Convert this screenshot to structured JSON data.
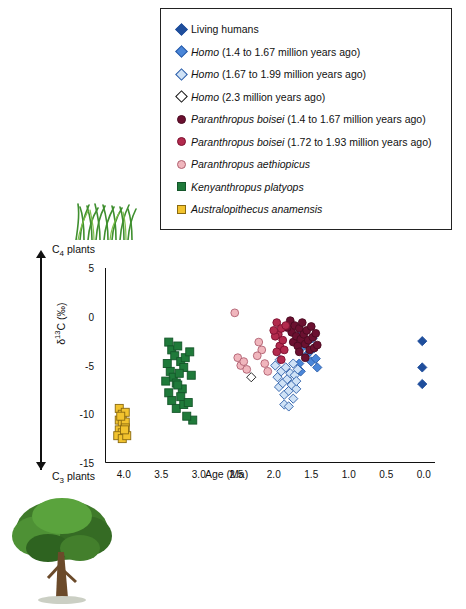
{
  "legend": {
    "items": [
      {
        "label": "Living humans",
        "shape": "diamond",
        "fill": "#1f4e9c",
        "stroke": "#1f4e9c",
        "italic_prefix": ""
      },
      {
        "label": "(1.4 to 1.67 million years ago)",
        "shape": "diamond",
        "fill": "#4a86d8",
        "stroke": "#2a5ca8",
        "italic_prefix": "Homo"
      },
      {
        "label": "(1.67 to 1.99 million years ago)",
        "shape": "diamond",
        "fill": "#cfe2f6",
        "stroke": "#2a5ca8",
        "italic_prefix": "Homo"
      },
      {
        "label": "(2.3 million years ago)",
        "shape": "diamond",
        "fill": "#ffffff",
        "stroke": "#111111",
        "italic_prefix": "Homo"
      },
      {
        "label": "(1.4 to 1.67 million years ago)",
        "shape": "circle",
        "fill": "#6b1030",
        "stroke": "#4a0a20",
        "italic_prefix": "Paranthropus boisei"
      },
      {
        "label": "(1.72 to 1.93 million years ago)",
        "shape": "circle",
        "fill": "#b22a4d",
        "stroke": "#7d1030",
        "italic_prefix": "Paranthropus boisei"
      },
      {
        "label": "",
        "shape": "circle",
        "fill": "#f0b6bd",
        "stroke": "#b06070",
        "italic_prefix": "Paranthropus aethiopicus"
      },
      {
        "label": "",
        "shape": "square",
        "fill": "#1f7a3a",
        "stroke": "#14562a",
        "italic_prefix": "Kenyanthropus platyops"
      },
      {
        "label": "",
        "shape": "square",
        "fill": "#f2c32e",
        "stroke": "#8a6a10",
        "italic_prefix": "Australopithecus anamensis"
      }
    ]
  },
  "annotations": {
    "c4_label": "C4 plants",
    "c4_sub": "4",
    "c3_label": "C3 plants",
    "c3_sub": "3"
  },
  "chart_data": {
    "type": "scatter",
    "title": "",
    "xlabel": "Age (Ma)",
    "ylabel": "δ¹³C (‰)",
    "xlim": [
      4.25,
      -0.15
    ],
    "ylim": [
      -15,
      5
    ],
    "xticks": [
      "4.0",
      "3.5",
      "3.0",
      "2.5",
      "2.0",
      "1.5",
      "1.0",
      "0.5",
      "0.0"
    ],
    "xtickvals": [
      4.0,
      3.5,
      3.0,
      2.5,
      2.0,
      1.5,
      1.0,
      0.5,
      0.0
    ],
    "yticks": [
      "5",
      "0",
      "-5",
      "-10",
      "-15"
    ],
    "ytickvals": [
      5,
      0,
      -5,
      -10,
      -15
    ],
    "grid": false,
    "legend_position": "top",
    "series": [
      {
        "name": "Living humans",
        "shape": "diamond",
        "fill": "#1f4e9c",
        "stroke": "#1f4e9c",
        "points": [
          [
            0.02,
            -2.5
          ],
          [
            0.02,
            -5.2
          ],
          [
            0.02,
            -6.9
          ]
        ]
      },
      {
        "name": "Homo (1.4 to 1.67 million years ago)",
        "shape": "diamond",
        "fill": "#4a86d8",
        "stroke": "#2a5ca8",
        "points": [
          [
            1.62,
            -1.6
          ],
          [
            1.6,
            -3.0
          ],
          [
            1.57,
            -4.0
          ],
          [
            1.55,
            -2.6
          ],
          [
            1.52,
            -3.6
          ],
          [
            1.5,
            -4.6
          ],
          [
            1.48,
            -2.2
          ],
          [
            1.46,
            -3.2
          ],
          [
            1.44,
            -4.3
          ],
          [
            1.42,
            -5.2
          ],
          [
            1.66,
            -4.8
          ],
          [
            1.64,
            -5.6
          ]
        ]
      },
      {
        "name": "Homo (1.67 to 1.99 million years ago)",
        "shape": "diamond",
        "fill": "#cfe2f6",
        "stroke": "#2a5ca8",
        "points": [
          [
            1.98,
            -5.0
          ],
          [
            1.95,
            -6.2
          ],
          [
            1.93,
            -7.2
          ],
          [
            1.9,
            -5.6
          ],
          [
            1.88,
            -6.8
          ],
          [
            1.86,
            -8.0
          ],
          [
            1.84,
            -5.2
          ],
          [
            1.82,
            -6.4
          ],
          [
            1.8,
            -7.6
          ],
          [
            1.78,
            -5.8
          ],
          [
            1.76,
            -7.0
          ],
          [
            1.74,
            -8.4
          ],
          [
            1.72,
            -6.0
          ],
          [
            1.7,
            -7.4
          ],
          [
            1.68,
            -5.4
          ],
          [
            1.86,
            -9.0
          ],
          [
            1.8,
            -9.2
          ],
          [
            1.92,
            -4.4
          ],
          [
            1.74,
            -4.8
          ],
          [
            1.7,
            -6.6
          ]
        ]
      },
      {
        "name": "Homo (2.3 million years ago)",
        "shape": "diamond",
        "fill": "#ffffff",
        "stroke": "#111111",
        "points": [
          [
            2.3,
            -6.2
          ]
        ]
      },
      {
        "name": "Paranthropus boisei (1.4 to 1.67 million years ago)",
        "shape": "circle",
        "fill": "#6b1030",
        "stroke": "#4a0a20",
        "points": [
          [
            1.78,
            -0.4
          ],
          [
            1.76,
            -1.6
          ],
          [
            1.74,
            -2.6
          ],
          [
            1.72,
            -0.9
          ],
          [
            1.7,
            -2.0
          ],
          [
            1.68,
            -3.0
          ],
          [
            1.66,
            -1.2
          ],
          [
            1.64,
            -2.3
          ],
          [
            1.62,
            -0.6
          ],
          [
            1.6,
            -1.8
          ],
          [
            1.58,
            -2.8
          ],
          [
            1.56,
            -1.4
          ],
          [
            1.54,
            -2.4
          ],
          [
            1.52,
            -3.4
          ],
          [
            1.5,
            -1.0
          ],
          [
            1.48,
            -2.1
          ],
          [
            1.46,
            -3.2
          ],
          [
            1.44,
            -1.7
          ],
          [
            1.42,
            -2.9
          ],
          [
            1.82,
            -1.1
          ],
          [
            1.66,
            -3.6
          ],
          [
            1.58,
            -4.2
          ]
        ]
      },
      {
        "name": "Paranthropus boisei (1.72 to 1.93 million years ago)",
        "shape": "circle",
        "fill": "#b22a4d",
        "stroke": "#7d1030",
        "points": [
          [
            1.96,
            -0.6
          ],
          [
            1.94,
            -1.8
          ],
          [
            1.92,
            -3.0
          ],
          [
            1.9,
            -1.2
          ],
          [
            1.88,
            -2.4
          ],
          [
            1.86,
            -3.4
          ],
          [
            1.84,
            -0.9
          ],
          [
            1.98,
            -2.0
          ],
          [
            1.96,
            -3.6
          ],
          [
            1.9,
            -4.4
          ],
          [
            2.0,
            -1.4
          ]
        ]
      },
      {
        "name": "Paranthropus aethiopicus",
        "shape": "circle",
        "fill": "#f0b6bd",
        "stroke": "#b06070",
        "points": [
          [
            2.52,
            0.4
          ],
          [
            2.48,
            -4.2
          ],
          [
            2.44,
            -5.0
          ],
          [
            2.4,
            -4.6
          ],
          [
            2.36,
            -5.4
          ],
          [
            2.2,
            -2.6
          ],
          [
            2.16,
            -3.4
          ],
          [
            2.12,
            -4.8
          ],
          [
            2.08,
            -5.6
          ],
          [
            2.22,
            -4.0
          ]
        ]
      },
      {
        "name": "Kenyanthropus platyops",
        "shape": "square",
        "fill": "#1f7a3a",
        "stroke": "#14562a",
        "points": [
          [
            3.4,
            -2.6
          ],
          [
            3.36,
            -3.4
          ],
          [
            3.32,
            -4.0
          ],
          [
            3.28,
            -3.0
          ],
          [
            3.24,
            -4.6
          ],
          [
            3.2,
            -5.2
          ],
          [
            3.38,
            -5.6
          ],
          [
            3.34,
            -6.2
          ],
          [
            3.3,
            -6.8
          ],
          [
            3.26,
            -5.8
          ],
          [
            3.22,
            -7.4
          ],
          [
            3.18,
            -4.2
          ],
          [
            3.44,
            -6.6
          ],
          [
            3.4,
            -7.8
          ],
          [
            3.36,
            -8.6
          ],
          [
            3.3,
            -9.4
          ],
          [
            3.24,
            -8.2
          ],
          [
            3.2,
            -9.0
          ],
          [
            3.12,
            -3.6
          ],
          [
            3.1,
            -6.0
          ],
          [
            3.08,
            -10.6
          ],
          [
            3.16,
            -10.2
          ],
          [
            3.42,
            -4.8
          ],
          [
            3.28,
            -7.0
          ],
          [
            3.14,
            -8.8
          ]
        ]
      },
      {
        "name": "Australopithecus anamensis",
        "shape": "square",
        "fill": "#f2c32e",
        "stroke": "#8a6a10",
        "points": [
          [
            4.06,
            -9.4
          ],
          [
            4.02,
            -10.0
          ],
          [
            3.98,
            -9.8
          ],
          [
            4.06,
            -10.6
          ],
          [
            4.02,
            -11.0
          ],
          [
            3.98,
            -10.8
          ],
          [
            4.06,
            -11.6
          ],
          [
            4.02,
            -11.9
          ],
          [
            3.98,
            -11.4
          ],
          [
            4.08,
            -12.2
          ],
          [
            4.02,
            -12.5
          ],
          [
            3.96,
            -12.2
          ],
          [
            4.04,
            -10.2
          ],
          [
            3.99,
            -11.6
          ]
        ]
      }
    ]
  }
}
